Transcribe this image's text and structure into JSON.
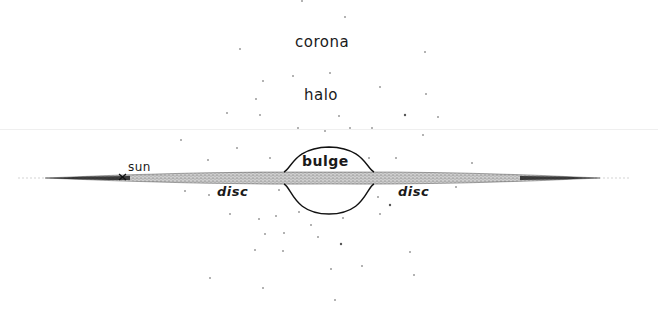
{
  "diagram": {
    "labels": {
      "corona": "corona",
      "halo": "halo",
      "bulge": "bulge",
      "sun": "sun",
      "disc_left": "disc",
      "disc_right": "disc"
    },
    "markers": {
      "sun_marker": "x"
    },
    "colors": {
      "ink": "#1a1a1a",
      "disc_fill": "#9a9a9a",
      "stars": "#b0b0b0",
      "background": "#ffffff"
    },
    "components": [
      "corona",
      "halo",
      "bulge",
      "disc",
      "sun"
    ]
  }
}
